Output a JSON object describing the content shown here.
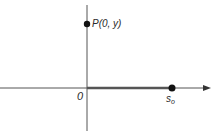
{
  "figure": {
    "axes": {
      "origin_label": "0",
      "horizontal_arrow": true
    },
    "points": [
      {
        "id": "P",
        "label": "P(0, y)",
        "x": 0,
        "y": "y"
      },
      {
        "id": "s0",
        "label_main": "s",
        "label_sub": "o",
        "position": "s_o on x-axis"
      }
    ],
    "segment": {
      "from": "0",
      "to": "s_o",
      "style": "thick"
    },
    "colors": {
      "stroke": "#333333",
      "segment": "#555555",
      "point": "#111111"
    }
  }
}
